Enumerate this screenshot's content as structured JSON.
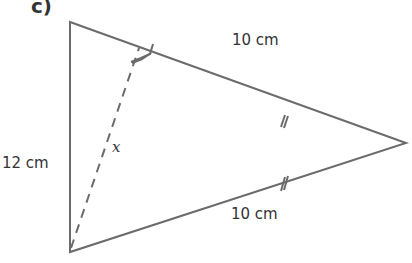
{
  "part_label": "c)",
  "diagram": {
    "shape": "isosceles triangle",
    "vertices": {
      "top": [
        70,
        22
      ],
      "bottom": [
        70,
        252
      ],
      "apex": [
        406,
        143
      ]
    },
    "labels": {
      "left_side": "12 cm",
      "top_side": "10 cm",
      "bottom_side": "10 cm",
      "altitude": "x"
    },
    "line_color": "#6b6b6b"
  }
}
